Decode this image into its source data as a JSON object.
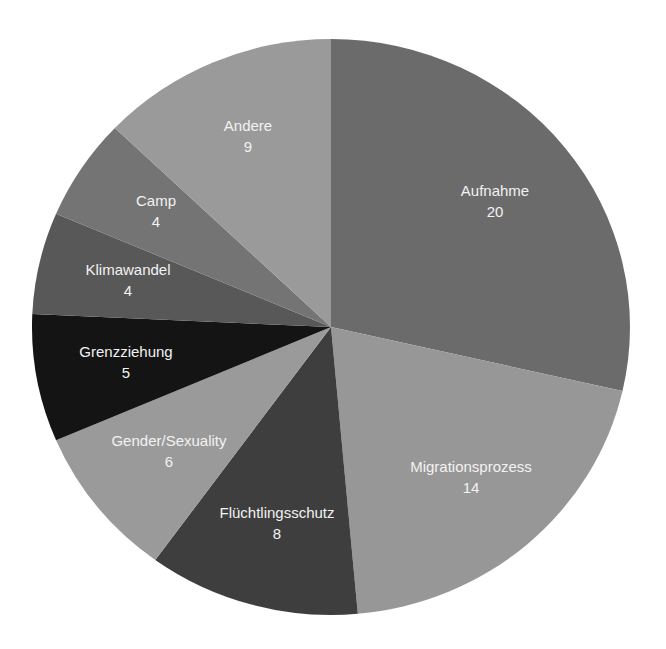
{
  "chart_data": {
    "type": "pie",
    "title": "",
    "start_angle_deg": 0,
    "direction": "clockwise",
    "total": 70,
    "slices": [
      {
        "label": "Aufnahme",
        "value": 20,
        "color": "#6b6b6b",
        "label_pos": [
          495,
          196
        ]
      },
      {
        "label": "Migrationsprozess",
        "value": 14,
        "color": "#979797",
        "label_pos": [
          471,
          472
        ]
      },
      {
        "label": "Flüchtlingsschutz",
        "value": 8,
        "color": "#3e3e3e",
        "label_pos": [
          277,
          518
        ]
      },
      {
        "label": "Gender/Sexuality",
        "value": 6,
        "color": "#9a9a9a",
        "label_pos": [
          169,
          446
        ]
      },
      {
        "label": "Grenzziehung",
        "value": 5,
        "color": "#141414",
        "label_pos": [
          126,
          357
        ]
      },
      {
        "label": "Klimawandel",
        "value": 4,
        "color": "#585858",
        "label_pos": [
          128,
          275
        ]
      },
      {
        "label": "Camp",
        "value": 4,
        "color": "#747474",
        "label_pos": [
          156,
          206
        ]
      },
      {
        "label": "Andere",
        "value": 9,
        "color": "#9a9a9a",
        "label_pos": [
          248,
          131
        ]
      }
    ],
    "geometry": {
      "cx": 331,
      "cy": 327,
      "rx": 299,
      "ry": 288
    },
    "legend": "none (labels inside slices)"
  }
}
